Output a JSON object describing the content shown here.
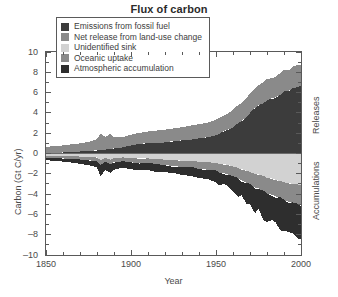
{
  "chart_data": {
    "type": "area",
    "title": "Flux of carbon",
    "xlabel": "Year",
    "ylabel": "Carbon (Gt C/yr)",
    "xlim": [
      1850,
      2000
    ],
    "ylim": [
      -10,
      10
    ],
    "grid": false,
    "legend_position": "top-center-inside",
    "x_ticks": [
      1850,
      1900,
      1950,
      2000
    ],
    "x_minor_tick_step": 10,
    "y_ticks": [
      10,
      8,
      6,
      4,
      2,
      0,
      -2,
      -4,
      -6,
      -8,
      -10
    ],
    "side_labels": {
      "upper": "Releases",
      "lower": "Accumulations"
    },
    "legend": [
      {
        "label": "Emissions from fossil fuel",
        "color": "#3c3c3c"
      },
      {
        "label": "Net release from land-use change",
        "color": "#8a8a8a"
      },
      {
        "label": "Unidentified sink",
        "color": "#d2d2d2"
      },
      {
        "label": "Oceanic uptake",
        "color": "#8a8a8a"
      },
      {
        "label": "Atmospheric accumulation",
        "color": "#2e2e2e"
      }
    ],
    "x": [
      1850,
      1855,
      1860,
      1865,
      1870,
      1875,
      1880,
      1882,
      1885,
      1888,
      1890,
      1895,
      1900,
      1905,
      1910,
      1915,
      1920,
      1925,
      1930,
      1935,
      1940,
      1945,
      1950,
      1952,
      1955,
      1958,
      1960,
      1963,
      1965,
      1968,
      1970,
      1973,
      1975,
      1978,
      1980,
      1983,
      1985,
      1988,
      1990,
      1993,
      1995,
      1998,
      2000
    ],
    "series": [
      {
        "name": "Emissions from fossil fuel",
        "color": "#3c3c3c",
        "side": "releases",
        "values": [
          0.05,
          0.08,
          0.1,
          0.15,
          0.2,
          0.25,
          0.3,
          0.35,
          0.4,
          0.45,
          0.5,
          0.6,
          0.8,
          0.95,
          1.0,
          1.05,
          1.1,
          1.2,
          1.3,
          1.35,
          1.5,
          1.6,
          1.8,
          2.0,
          2.2,
          2.4,
          2.6,
          3.0,
          3.2,
          3.6,
          4.0,
          4.5,
          4.7,
          5.0,
          5.3,
          5.4,
          5.5,
          5.8,
          6.1,
          6.2,
          6.4,
          6.6,
          6.7
        ]
      },
      {
        "name": "Net release from land-use change",
        "color": "#8a8a8a",
        "side": "releases",
        "values": [
          0.6,
          0.65,
          0.7,
          0.75,
          0.8,
          0.9,
          1.1,
          1.6,
          1.2,
          1.5,
          1.1,
          1.0,
          1.05,
          1.1,
          1.15,
          1.2,
          1.25,
          1.3,
          1.3,
          1.35,
          1.4,
          1.45,
          1.5,
          1.55,
          1.6,
          1.65,
          1.7,
          1.75,
          1.8,
          1.85,
          1.9,
          1.95,
          2.0,
          2.0,
          2.05,
          2.05,
          2.1,
          2.1,
          2.1,
          2.1,
          2.1,
          2.1,
          2.1
        ]
      },
      {
        "name": "Unidentified sink",
        "color": "#d2d2d2",
        "side": "accumulations",
        "values": [
          0.2,
          0.22,
          0.25,
          0.28,
          0.3,
          0.35,
          0.4,
          0.65,
          0.45,
          0.6,
          0.45,
          0.4,
          0.45,
          0.5,
          0.5,
          0.55,
          0.6,
          0.65,
          0.7,
          0.75,
          0.8,
          0.85,
          0.95,
          1.0,
          1.1,
          1.2,
          1.3,
          1.45,
          1.55,
          1.7,
          1.85,
          2.0,
          2.1,
          2.25,
          2.4,
          2.5,
          2.6,
          2.75,
          2.85,
          2.9,
          3.0,
          3.05,
          3.1
        ]
      },
      {
        "name": "Oceanic uptake",
        "color": "#8a8a8a",
        "side": "accumulations",
        "values": [
          0.2,
          0.22,
          0.24,
          0.26,
          0.3,
          0.32,
          0.36,
          0.5,
          0.4,
          0.45,
          0.4,
          0.4,
          0.42,
          0.45,
          0.48,
          0.5,
          0.55,
          0.6,
          0.62,
          0.65,
          0.7,
          0.75,
          0.8,
          0.85,
          0.9,
          0.95,
          1.0,
          1.05,
          1.1,
          1.2,
          1.25,
          1.35,
          1.4,
          1.5,
          1.55,
          1.6,
          1.65,
          1.7,
          1.8,
          1.85,
          1.9,
          1.95,
          2.0
        ]
      },
      {
        "name": "Atmospheric accumulation",
        "color": "#2e2e2e",
        "side": "accumulations",
        "values": [
          0.25,
          0.29,
          0.31,
          0.36,
          0.4,
          0.48,
          0.64,
          1.05,
          0.75,
          0.9,
          0.75,
          0.6,
          0.68,
          0.7,
          0.67,
          0.7,
          0.7,
          0.75,
          0.78,
          0.8,
          0.9,
          0.95,
          1.05,
          1.2,
          1.1,
          1.35,
          1.3,
          1.75,
          1.5,
          2.05,
          1.9,
          2.55,
          2.1,
          2.75,
          2.6,
          2.6,
          2.6,
          3.1,
          2.95,
          3.0,
          3.0,
          3.2,
          3.4
        ]
      }
    ]
  }
}
